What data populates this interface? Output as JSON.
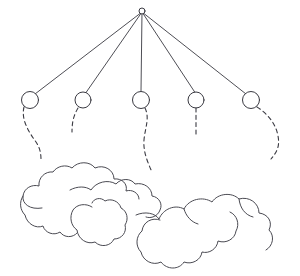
{
  "canvas": {
    "width": 300,
    "height": 276,
    "background_color": "#ffffff",
    "ink_color": "#3a3a42",
    "cloud_ink_color": "#4a4a52"
  },
  "figure": {
    "style": "black-and-white line drawing",
    "apex": {
      "label": "apex-hub",
      "cx": 142,
      "cy": 11,
      "r": 3
    },
    "strings": [
      {
        "label": "string-1",
        "x1": 142,
        "y1": 12,
        "x2": 35,
        "y2": 94
      },
      {
        "label": "string-2",
        "x1": 142,
        "y1": 12,
        "x2": 85,
        "y2": 94
      },
      {
        "label": "string-3",
        "x1": 142,
        "y1": 12,
        "x2": 141,
        "y2": 92
      },
      {
        "label": "string-4",
        "x1": 142,
        "y1": 12,
        "x2": 196,
        "y2": 94
      },
      {
        "label": "string-5",
        "x1": 142,
        "y1": 12,
        "x2": 246,
        "y2": 94
      }
    ],
    "nodes": [
      {
        "label": "node-1",
        "cx": 30,
        "cy": 100,
        "r": 8.5
      },
      {
        "label": "node-2",
        "cx": 83,
        "cy": 100,
        "r": 8.0
      },
      {
        "label": "node-3",
        "cx": 141,
        "cy": 100,
        "r": 8.5
      },
      {
        "label": "node-4",
        "cx": 196,
        "cy": 100,
        "r": 8.0
      },
      {
        "label": "node-5",
        "cx": 251,
        "cy": 100,
        "r": 8.5
      }
    ],
    "tails": [
      {
        "label": "tail-1",
        "path": "M 24 107 C 21 119, 28 131, 36 142 C 40 148, 41 153, 41 160"
      },
      {
        "label": "tail-2",
        "path": "M 78 108 C 74 115, 72 121, 72 132"
      },
      {
        "label": "tail-3",
        "path": "M 145 108 C 150 118, 145 128, 144 140 C 143 152, 148 163, 152 172"
      },
      {
        "label": "tail-4",
        "path": "M 196 108 C 196 116, 196 124, 196 134"
      },
      {
        "label": "tail-5",
        "path": "M 257 107 C 268 114, 276 124, 278 136 C 280 146, 277 152, 271 159"
      }
    ],
    "clouds": [
      {
        "label": "cloud-left",
        "path": "M 42 208 C 30 210, 22 204, 23 196 C 24 188, 32 184, 39 186 C 38 178, 45 171, 53 172 C 57 166, 66 164, 72 168 C 78 161, 90 161, 95 168 C 104 164, 114 170, 114 179 C 122 178, 128 184, 126 191 C 132 189, 139 193, 139 199"
      },
      {
        "label": "cloud-left-lower",
        "path": "M 23 196 C 19 202, 20 210, 25 215 C 27 224, 36 229, 43 226 C 45 233, 54 236, 60 232 C 64 238, 73 238, 77 233"
      },
      {
        "label": "cloud-mid-top",
        "path": "M 70 190 C 77 186, 86 186, 91 190 C 96 182, 108 179, 116 184 C 121 178, 131 178, 135 184 C 144 182, 152 188, 152 196 C 159 197, 163 204, 160 210 C 158 216, 151 219, 146 217"
      },
      {
        "label": "cloud-mid-body",
        "path": "M 92 207 C 86 203, 77 204, 73 210 C 69 217, 71 226, 77 230 C 78 239, 87 245, 95 242 C 101 248, 111 246, 114 239 C 122 239, 127 232, 125 225 C 129 219, 127 211, 121 208 C 119 201, 111 198, 105 201 C 101 197, 94 198, 92 203"
      },
      {
        "label": "cloud-right",
        "path": "M 136 215 C 145 211, 155 213, 159 219 C 163 209, 175 204, 184 209 C 189 199, 203 196, 212 202 C 218 193, 232 192, 239 199 C 249 196, 259 203, 259 213 C 268 214, 273 222, 269 230 C 275 236, 273 246, 266 250"
      },
      {
        "label": "cloud-right-lower",
        "path": "M 160 220 C 152 217, 143 222, 142 231 C 136 236, 135 246, 141 252 C 143 261, 153 266, 161 262 C 167 270, 179 270, 184 262 C 192 265, 201 260, 202 252 C 209 254, 217 249, 218 241 C 226 244, 235 239, 236 231 C 240 224, 237 215, 230 212"
      },
      {
        "label": "cloud-right-accent",
        "path": "M 184 209 C 186 216, 191 222, 198 224"
      },
      {
        "label": "cloud-right-accent-2",
        "path": "M 239 199 C 240 208, 245 215, 253 217"
      }
    ]
  }
}
